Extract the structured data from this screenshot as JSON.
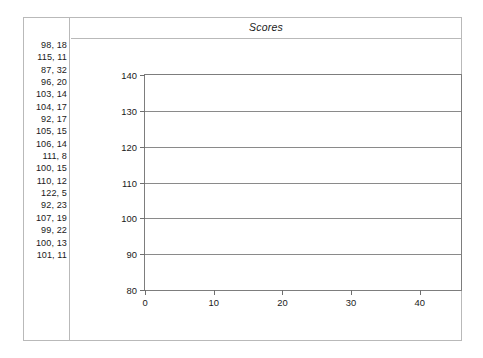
{
  "figure": {
    "title": "Scores"
  },
  "data_column": {
    "name": "data-values-list",
    "items": [
      "98, 18",
      "115, 11",
      "87, 32",
      "96, 20",
      "103, 14",
      "104, 17",
      "92, 17",
      "105, 15",
      "106, 14",
      "111, 8",
      "100, 15",
      "110, 12",
      "122, 5",
      "92, 23",
      "107, 19",
      "99, 22",
      "100, 13",
      "101, 11"
    ]
  },
  "chart_data": {
    "type": "scatter",
    "title": "Scores",
    "xlabel": "",
    "ylabel": "",
    "xlim": [
      0,
      46
    ],
    "ylim": [
      80,
      140
    ],
    "grid": true,
    "gridlines_horizontal": [
      80,
      90,
      100,
      110,
      120,
      130,
      140
    ],
    "legend": null,
    "y_ticks": [
      80,
      90,
      100,
      110,
      120,
      130,
      140
    ],
    "y_tick_labels": [
      "80",
      "90",
      "100",
      "110",
      "120",
      "130",
      "140"
    ],
    "x_ticks": [
      0,
      10,
      20,
      30,
      40
    ],
    "x_tick_labels": [
      "0",
      "10",
      "20",
      "30",
      "40"
    ],
    "series": [
      {
        "name": "Scores",
        "points": [
          [
            98,
            18
          ],
          [
            115,
            11
          ],
          [
            87,
            32
          ],
          [
            96,
            20
          ],
          [
            103,
            14
          ],
          [
            104,
            17
          ],
          [
            92,
            17
          ],
          [
            105,
            15
          ],
          [
            106,
            14
          ],
          [
            111,
            8
          ],
          [
            100,
            15
          ],
          [
            110,
            12
          ],
          [
            122,
            5
          ],
          [
            92,
            23
          ],
          [
            107,
            19
          ],
          [
            99,
            22
          ],
          [
            100,
            13
          ],
          [
            101,
            11
          ]
        ],
        "rendered": false
      }
    ],
    "note": "plot frame is empty - no markers drawn inside axes"
  },
  "colors": {
    "frame_border": "#b9b9b9",
    "plot_border": "#7d7d7d",
    "gridline": "#8a8a8a",
    "text": "#1a1a1a",
    "background": "#ffffff"
  }
}
